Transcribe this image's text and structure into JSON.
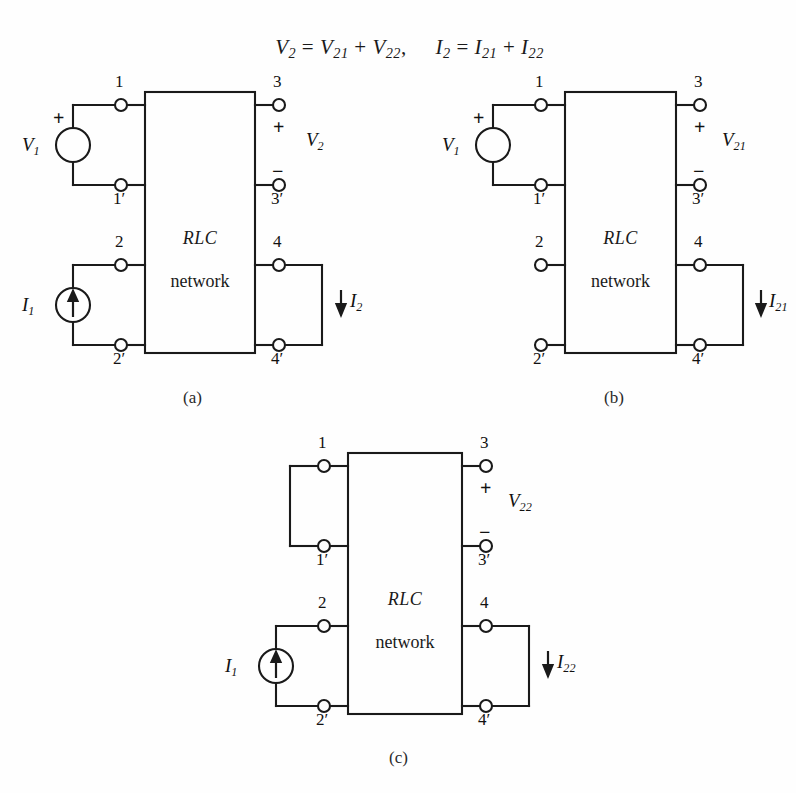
{
  "equation": {
    "left": {
      "lhs": "V",
      "lhs_sub": "2",
      "eq": " = ",
      "t1": "V",
      "t1_sub": "21",
      "plus": " + ",
      "t2": "V",
      "t2_sub": "22",
      "comma": ","
    },
    "right": {
      "lhs": "I",
      "lhs_sub": "2",
      "eq": " = ",
      "t1": "I",
      "t1_sub": "21",
      "plus": " + ",
      "t2": "I",
      "t2_sub": "22"
    },
    "full_text": "V2 = V21 + V22,     I2 = I21 + I22"
  },
  "figures": [
    {
      "id": "a",
      "caption": "(a)",
      "box": {
        "line1": "RLC",
        "line2": "network"
      },
      "terminals": [
        {
          "name": "1",
          "label": "1"
        },
        {
          "name": "1p",
          "label": "1′"
        },
        {
          "name": "2",
          "label": "2"
        },
        {
          "name": "2p",
          "label": "2′"
        },
        {
          "name": "3",
          "label": "3"
        },
        {
          "name": "3p",
          "label": "3′"
        },
        {
          "name": "4",
          "label": "4"
        },
        {
          "name": "4p",
          "label": "4′"
        }
      ],
      "sources": [
        {
          "kind": "voltage-source",
          "label": "V",
          "sub": "1",
          "plus": "+"
        },
        {
          "kind": "current-source",
          "label": "I",
          "sub": "1",
          "arrow": "up"
        }
      ],
      "outputs": [
        {
          "kind": "voltage-output",
          "label": "V",
          "sub": "2",
          "plus": "+",
          "minus": "−"
        },
        {
          "kind": "current-output",
          "label": "I",
          "sub": "2",
          "arrow": "down"
        }
      ]
    },
    {
      "id": "b",
      "caption": "(b)",
      "box": {
        "line1": "RLC",
        "line2": "network"
      },
      "terminals": [
        {
          "name": "1",
          "label": "1"
        },
        {
          "name": "1p",
          "label": "1′"
        },
        {
          "name": "2",
          "label": "2"
        },
        {
          "name": "2p",
          "label": "2′"
        },
        {
          "name": "3",
          "label": "3"
        },
        {
          "name": "3p",
          "label": "3′"
        },
        {
          "name": "4",
          "label": "4"
        },
        {
          "name": "4p",
          "label": "4′"
        }
      ],
      "sources": [
        {
          "kind": "voltage-source",
          "label": "V",
          "sub": "1",
          "plus": "+"
        }
      ],
      "outputs": [
        {
          "kind": "voltage-output",
          "label": "V",
          "sub": "21",
          "plus": "+",
          "minus": "−"
        },
        {
          "kind": "current-output",
          "label": "I",
          "sub": "21",
          "arrow": "down"
        }
      ]
    },
    {
      "id": "c",
      "caption": "(c)",
      "box": {
        "line1": "RLC",
        "line2": "network"
      },
      "terminals": [
        {
          "name": "1",
          "label": "1"
        },
        {
          "name": "1p",
          "label": "1′"
        },
        {
          "name": "2",
          "label": "2"
        },
        {
          "name": "2p",
          "label": "2′"
        },
        {
          "name": "3",
          "label": "3"
        },
        {
          "name": "3p",
          "label": "3′"
        },
        {
          "name": "4",
          "label": "4"
        },
        {
          "name": "4p",
          "label": "4′"
        }
      ],
      "sources": [
        {
          "kind": "current-source",
          "label": "I",
          "sub": "1",
          "arrow": "up"
        }
      ],
      "outputs": [
        {
          "kind": "voltage-output",
          "label": "V",
          "sub": "22",
          "plus": "+",
          "minus": "−"
        },
        {
          "kind": "current-output",
          "label": "I",
          "sub": "22",
          "arrow": "down"
        }
      ]
    }
  ],
  "colors": {
    "ink": "#1a1a1a",
    "paper": "#fefefe"
  }
}
